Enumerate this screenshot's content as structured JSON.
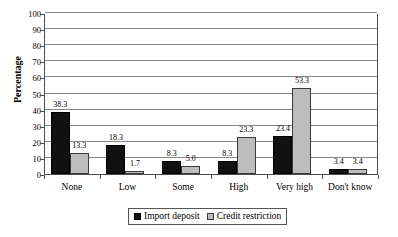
{
  "chart_data": {
    "type": "bar",
    "title": "",
    "xlabel": "",
    "ylabel": "Percentage",
    "ylim": [
      0,
      100
    ],
    "ytick_step": 10,
    "yticks": [
      100,
      90,
      80,
      70,
      60,
      50,
      40,
      30,
      20,
      10,
      0
    ],
    "grid": true,
    "legend_position": "bottom",
    "categories": [
      "None",
      "Low",
      "Some",
      "High",
      "Very high",
      "Don't know"
    ],
    "series": [
      {
        "name": "Import deposit",
        "color": "#111111",
        "values": [
          38.3,
          18.3,
          8.3,
          8.3,
          23.4,
          3.4
        ],
        "labels": [
          "38.3",
          "18.3",
          "8.3",
          "8.3",
          "23.4",
          "3.4"
        ]
      },
      {
        "name": "Credit restriction",
        "color": "#bdbdbd",
        "values": [
          13.3,
          1.7,
          5.0,
          23.3,
          53.3,
          3.4
        ],
        "labels": [
          "13.3",
          "1.7",
          "5.0",
          "23.3",
          "53.3",
          "3.4"
        ]
      }
    ]
  },
  "legend": {
    "entries": [
      {
        "label": "Import deposit",
        "swatch": "import"
      },
      {
        "label": "Credit restriction",
        "swatch": "credit"
      }
    ]
  }
}
